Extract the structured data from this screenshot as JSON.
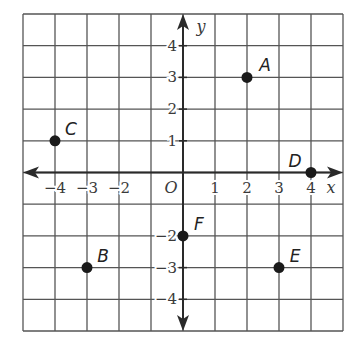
{
  "diagram": {
    "type": "coordinate-plane",
    "grid": {
      "x_min": -5,
      "x_max": 5,
      "y_min": -5,
      "y_max": 5,
      "step": 1
    },
    "axes": {
      "x_label": "x",
      "y_label": "y",
      "origin_label": "O",
      "x_ticks": [
        "-4",
        "-3",
        "-2",
        "1",
        "2",
        "3",
        "4"
      ],
      "x_tick_values": [
        -4,
        -3,
        -2,
        1,
        2,
        3,
        4
      ],
      "y_ticks": [
        "4",
        "3",
        "2",
        "1",
        "-2",
        "-3",
        "-4"
      ],
      "y_tick_values": [
        4,
        3,
        2,
        1,
        -2,
        -3,
        -4
      ]
    },
    "points": [
      {
        "label": "A",
        "x": 2,
        "y": 3
      },
      {
        "label": "B",
        "x": -3,
        "y": -3
      },
      {
        "label": "C",
        "x": -4,
        "y": 1
      },
      {
        "label": "D",
        "x": 4,
        "y": 0
      },
      {
        "label": "E",
        "x": 3,
        "y": -3
      },
      {
        "label": "F",
        "x": 0,
        "y": -2
      }
    ],
    "colors": {
      "grid": "#555555",
      "axis": "#2a2a2a",
      "point": "#1a1a1a",
      "background": "#ffffff"
    }
  }
}
